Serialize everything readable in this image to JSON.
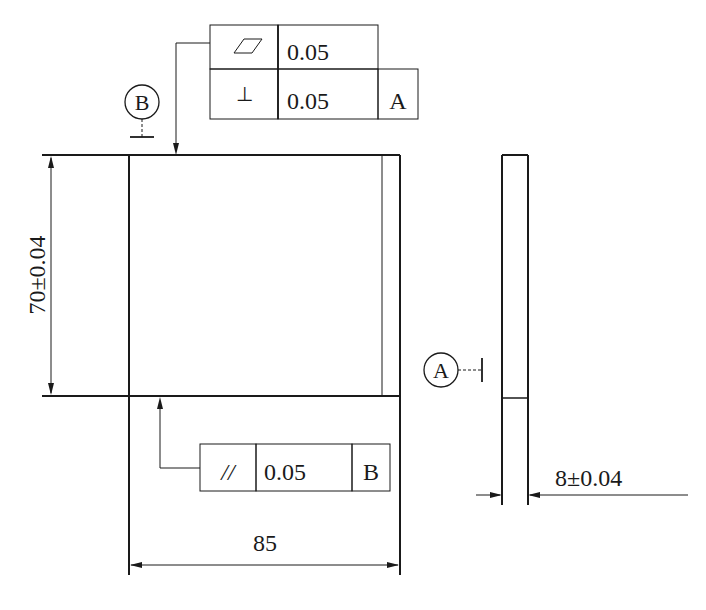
{
  "drawing": {
    "colors": {
      "line": "#1a1a1a",
      "background": "#ffffff"
    },
    "front_view": {
      "height_dimension": "70±0.04",
      "width_dimension": "85"
    },
    "side_view": {
      "thickness_dimension": "8±0.04"
    },
    "datums": {
      "a": {
        "label": "A"
      },
      "b": {
        "label": "B"
      }
    },
    "feature_control_frames": {
      "top": {
        "row1": {
          "symbol": "flatness-icon",
          "tolerance": "0.05"
        },
        "row2": {
          "symbol": "perpendicularity-icon",
          "symbol_glyph": "⊥",
          "tolerance": "0.05",
          "datum": "A"
        }
      },
      "bottom": {
        "symbol": "parallelism-icon",
        "symbol_glyph": "//",
        "tolerance": "0.05",
        "datum": "B"
      }
    }
  }
}
